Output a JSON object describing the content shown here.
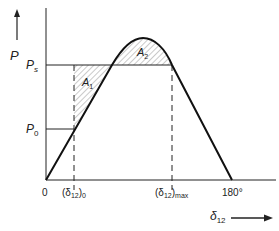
{
  "caption": "",
  "axes": {
    "y_label": "P",
    "x_label": "δ",
    "x_label_sub": "12"
  },
  "levels": {
    "ps": {
      "label": "P",
      "sub": "s"
    },
    "p0": {
      "label": "P",
      "sub": "0"
    }
  },
  "areas": {
    "a1": {
      "label": "A",
      "sub": "1"
    },
    "a2": {
      "label": "A",
      "sub": "2"
    }
  },
  "ticks": {
    "origin": "0",
    "d0": {
      "open": "(δ",
      "sub": "12",
      "close": ")",
      "subscript2": "0"
    },
    "dmax": {
      "open": "(δ",
      "sub": "12",
      "close": ")",
      "subscript2": "max"
    },
    "end": "180°"
  },
  "colors": {
    "ink": "#222222",
    "hatch": "#555555"
  }
}
